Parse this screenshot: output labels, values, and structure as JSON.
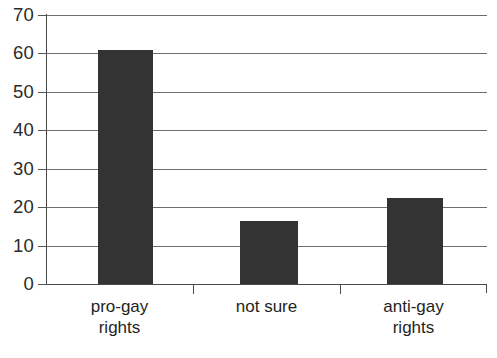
{
  "chart_data": {
    "type": "bar",
    "title": "",
    "subtitle": "",
    "xlabel": "",
    "ylabel": "",
    "categories": [
      "pro-gay rights",
      "not sure",
      "anti-gay rights"
    ],
    "category_lines": [
      [
        "pro-gay",
        "rights"
      ],
      [
        "not sure"
      ],
      [
        "anti-gay",
        "rights"
      ]
    ],
    "values": [
      61,
      16.5,
      22.5
    ],
    "ylim": [
      0,
      70
    ],
    "ytick_labels": [
      "0",
      "10",
      "20",
      "30",
      "40",
      "50",
      "60",
      "70"
    ],
    "ytick_values": [
      0,
      10,
      20,
      30,
      40,
      50,
      60,
      70
    ],
    "grid": "horizontal",
    "legend": "none",
    "bar_color": "#333333",
    "gridline_color": "#6e6e6e",
    "axis_color": "#4a4a4a",
    "background_color": "#ffffff"
  }
}
